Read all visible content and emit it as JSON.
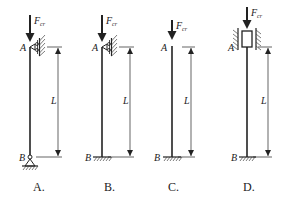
{
  "diagram": {
    "type": "column-buckling-support-conditions",
    "force_symbol": "F",
    "force_subscript": "cr",
    "length_label": "L",
    "top_point": "A",
    "bottom_point": "B",
    "options": [
      {
        "caption": "A.",
        "top_support": "guided-roller (lateral restraint)",
        "bottom_support": "pin",
        "column_x": 30,
        "dim_x": 58
      },
      {
        "caption": "B.",
        "top_support": "guided-roller (lateral restraint)",
        "bottom_support": "fixed",
        "column_x": 102,
        "dim_x": 130
      },
      {
        "caption": "C.",
        "top_support": "free",
        "bottom_support": "fixed",
        "column_x": 172,
        "dim_x": 191
      },
      {
        "caption": "D.",
        "top_support": "sliding sleeve (rotation restrained)",
        "bottom_support": "fixed",
        "column_x": 247,
        "dim_x": 268
      }
    ]
  },
  "colors": {
    "line": "#222222",
    "hatch": "#444444",
    "background": "#ffffff"
  }
}
